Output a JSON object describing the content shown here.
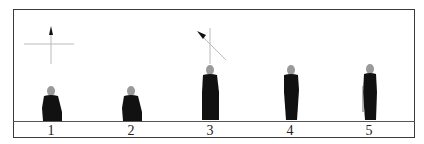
{
  "figure": {
    "colors": {
      "figure": "#111111",
      "head": "#9a9a9a",
      "line": "#555555",
      "guide": "#bbbbbb"
    },
    "indicators": [
      {
        "id": "upright-cross",
        "type": "crosshair-arrow",
        "direction": "up"
      },
      {
        "id": "diagonal-cross",
        "type": "crosshair-arrow",
        "direction": "up-left"
      }
    ],
    "poses": [
      {
        "label": "1",
        "pose": "kneeling"
      },
      {
        "label": "2",
        "pose": "kneeling"
      },
      {
        "label": "3",
        "pose": "standing"
      },
      {
        "label": "4",
        "pose": "standing"
      },
      {
        "label": "5",
        "pose": "standing-side"
      }
    ]
  }
}
